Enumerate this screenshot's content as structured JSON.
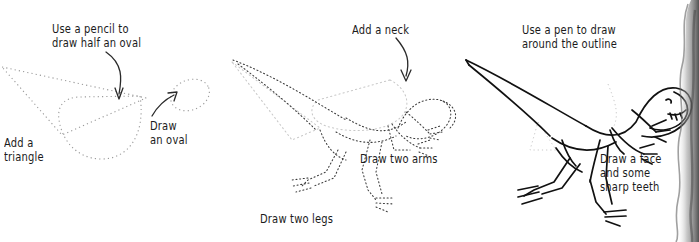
{
  "page": {
    "background_color": "#ffffff",
    "ink_color": "#1b1b1b",
    "guide_color": "#8c8c8c",
    "width": 699,
    "height": 242
  },
  "panels": [
    {
      "id": "panel-1",
      "step": 1,
      "captions": {
        "pencil": "Use a pencil to\ndraw half an oval",
        "triangle": "Add a\ntriangle",
        "oval": "Draw\nan oval"
      },
      "shapes": [
        "half-oval-body",
        "triangle-tail",
        "oval-head"
      ],
      "arrows": [
        "arrow-to-half-oval",
        "arrow-to-oval"
      ]
    },
    {
      "id": "panel-2",
      "step": 2,
      "captions": {
        "neck": "Add a neck",
        "arms": "Draw two arms",
        "legs": "Draw two legs"
      },
      "shapes": [
        "dotted-dinosaur-skeleton",
        "neck-curve",
        "two-arms",
        "two-legs"
      ],
      "arrows": [
        "arrow-to-neck"
      ]
    },
    {
      "id": "panel-3",
      "step": 3,
      "captions": {
        "outline": "Use a pen to draw\naround the outline",
        "face": "Draw a face\nand some\nsharp teeth"
      },
      "shapes": [
        "inked-dinosaur-outline",
        "face-and-teeth"
      ],
      "arrows": []
    }
  ],
  "scan_edge": {
    "label": "page-edge-shadow",
    "color": "#5a5a5a"
  }
}
